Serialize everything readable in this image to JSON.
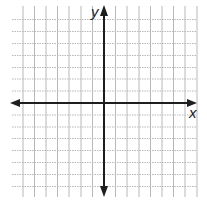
{
  "diagram": {
    "type": "coordinate-plane",
    "x_axis_label": "x",
    "y_axis_label": "y",
    "origin_px": [
      104,
      103
    ],
    "grid_spacing_px": [
      11.6,
      11.9
    ],
    "grid": {
      "vertical_lines_left_of_axis": 7,
      "vertical_lines_right_of_axis": 8,
      "horizontal_lines_above_axis": 7,
      "horizontal_lines_below_axis": 7
    },
    "colors": {
      "background": "#ffffff",
      "grid": "#b8b8b8",
      "axis": "#1e1e1e"
    }
  }
}
